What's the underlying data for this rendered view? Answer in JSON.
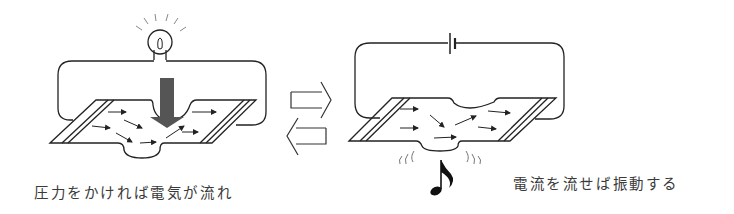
{
  "diagram": {
    "left_panel": {
      "caption": "圧力をかければ電気が流れ",
      "components": [
        "light-bulb",
        "circuit-wire",
        "piezo-plate",
        "pressure-arrow",
        "current-arrows"
      ]
    },
    "right_panel": {
      "caption": "電流を流せば振動する",
      "components": [
        "battery",
        "circuit-wire",
        "piezo-plate",
        "current-arrows",
        "vibration-marks",
        "music-note"
      ]
    },
    "center": {
      "symbol": "reversible-arrows",
      "meaning": "bidirectional conversion"
    }
  },
  "colors": {
    "line": "#222222",
    "pressure_arrow": "#555555",
    "text": "#3a3a3a"
  }
}
